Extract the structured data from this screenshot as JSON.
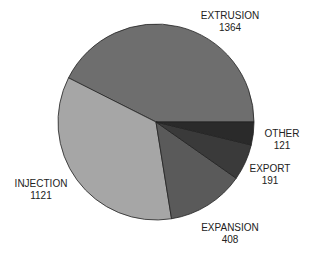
{
  "chart_data": {
    "type": "pie",
    "title": "",
    "categories": [
      "EXTRUSION",
      "INJECTION",
      "EXPANSION",
      "EXPORT",
      "OTHER"
    ],
    "values": [
      1364,
      1121,
      408,
      191,
      121
    ],
    "colors": [
      "#6e6e6e",
      "#a6a6a6",
      "#5a5a5a",
      "#3a3a3a",
      "#2a2a2a"
    ],
    "legend": "none (direct labels)"
  },
  "labels": {
    "extrusion": {
      "name": "EXTRUSION",
      "value": "1364"
    },
    "injection": {
      "name": "INJECTION",
      "value": "1121"
    },
    "expansion": {
      "name": "EXPANSION",
      "value": "408"
    },
    "export": {
      "name": "EXPORT",
      "value": "191"
    },
    "other": {
      "name": "OTHER",
      "value": "121"
    }
  }
}
